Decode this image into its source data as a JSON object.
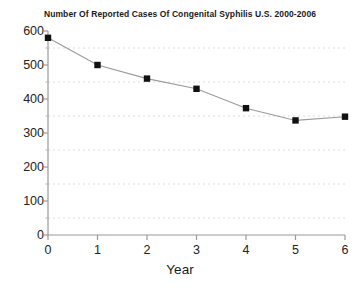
{
  "chart_data": {
    "type": "line",
    "title": "Number Of Reported Cases Of Congenital Syphilis U.S. 2000-2006",
    "xlabel": "Year",
    "ylabel": "",
    "x": [
      0,
      1,
      2,
      3,
      4,
      5,
      6
    ],
    "values": [
      580,
      500,
      460,
      430,
      373,
      337,
      348
    ],
    "series": [
      {
        "name": "Reported cases of congenital syphilis",
        "values": [
          580,
          500,
          460,
          430,
          373,
          337,
          348
        ]
      }
    ],
    "xlim": [
      0,
      6
    ],
    "ylim": [
      0,
      600
    ],
    "x_ticks": [
      "0",
      "1",
      "2",
      "3",
      "4",
      "5",
      "6"
    ],
    "y_ticks": [
      "0",
      "100",
      "200",
      "300",
      "400",
      "500",
      "600"
    ],
    "y_tick_values": [
      0,
      100,
      200,
      300,
      400,
      500,
      600
    ],
    "y_minor_tick_values": [
      50,
      150,
      250,
      350,
      450,
      550
    ],
    "grid": "horizontal-dashed-at-minor-ticks",
    "grid_values": [
      50,
      150,
      250,
      350,
      450,
      550
    ],
    "legend": "none",
    "marker": "filled-square",
    "marker_color": "#111111",
    "line_color": "#9b9b9b",
    "axis_color": "#9a9a9a",
    "grid_color": "#dcdcdc",
    "background_color": "#ffffff"
  }
}
